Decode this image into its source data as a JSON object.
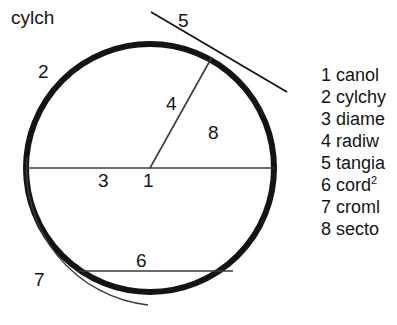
{
  "title": {
    "text": "cylch"
  },
  "figure": {
    "circle": {
      "center_x": 150,
      "center_y": 168,
      "radius": 124,
      "stroke_color": "#141414",
      "stroke_width": 6
    },
    "diameter_line": {
      "x1": 27,
      "y1": 168,
      "x2": 274,
      "y2": 168,
      "stroke_color": "#3a3a3a",
      "stroke_width": 1.6
    },
    "radius_line": {
      "x1": 150,
      "y1": 168,
      "x2": 212,
      "y2": 57,
      "stroke_color": "#3a3a3a",
      "stroke_width": 1.6
    },
    "tangent_line": {
      "x1": 151,
      "y1": 12,
      "x2": 287,
      "y2": 92,
      "stroke_color": "#141414",
      "stroke_width": 1.8
    },
    "chord_line": {
      "x1": 79,
      "y1": 271,
      "x2": 233,
      "y2": 271,
      "stroke_color": "#3a3a3a",
      "stroke_width": 1.6
    },
    "outer_arc": {
      "stroke_color": "#3a3a3a",
      "stroke_width": 1.4
    }
  },
  "labels": [
    {
      "id": "2",
      "text": "2"
    },
    {
      "id": "5",
      "text": "5"
    },
    {
      "id": "4",
      "text": "4"
    },
    {
      "id": "8",
      "text": "8"
    },
    {
      "id": "3",
      "text": "3"
    },
    {
      "id": "1",
      "text": "1"
    },
    {
      "id": "6",
      "text": "6"
    },
    {
      "id": "7",
      "text": "7"
    }
  ],
  "legend": {
    "items": [
      {
        "number": "1",
        "label": "canol"
      },
      {
        "number": "2",
        "label": "cylchy"
      },
      {
        "number": "3",
        "label": "diame"
      },
      {
        "number": "4",
        "label": "radiw"
      },
      {
        "number": "5",
        "label": "tangia"
      },
      {
        "number": "6",
        "label": "cord",
        "superscript": "2"
      },
      {
        "number": "7",
        "label": "croml"
      },
      {
        "number": "8",
        "label": "secto"
      }
    ]
  }
}
